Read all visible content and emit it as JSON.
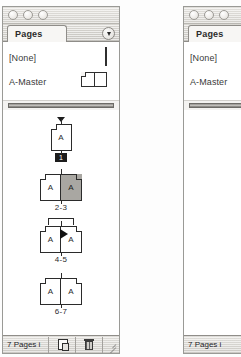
{
  "window": {
    "controls": [
      "close-button",
      "minimize-button",
      "zoom-button"
    ],
    "tab_label": "Pages",
    "flyout_icon": "panel-menu-triangle-icon"
  },
  "masters": {
    "rows": [
      {
        "label": "[None]",
        "icon": "single-page-icon"
      },
      {
        "label": "A-Master",
        "icon": "two-page-spread-icon"
      }
    ]
  },
  "pages": {
    "items": [
      {
        "caption": "1",
        "caption_style": "badge",
        "page_letters": [
          "A"
        ],
        "selected": [
          false
        ],
        "marker": "drop-triangle"
      },
      {
        "caption": "2-3",
        "caption_style": "plain",
        "page_letters": [
          "A",
          "A"
        ],
        "selected": [
          false,
          true
        ],
        "marker": "none"
      },
      {
        "caption": "4-5",
        "caption_style": "plain",
        "page_letters": [
          "A",
          "A"
        ],
        "selected": [
          false,
          false
        ],
        "marker": "drag-bracket-with-cursor"
      },
      {
        "caption": "6-7",
        "caption_style": "plain",
        "page_letters": [
          "A",
          "A"
        ],
        "selected": [
          false,
          false
        ],
        "marker": "none"
      }
    ]
  },
  "status": {
    "text": "7 Pages i",
    "new_page_icon": "new-page-icon",
    "delete_icon": "trash-icon",
    "resize_icon": "resize-grip-icon"
  },
  "colors": {
    "panel_bg": "#f2f1ef",
    "content_bg": "#ffffff",
    "outline": "#2b2b2b",
    "selection": "#a9a7a2",
    "badge_bg": "#1c1c1c",
    "badge_fg": "#ffffff"
  }
}
